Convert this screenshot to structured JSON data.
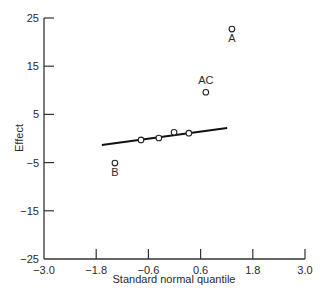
{
  "chart_data": {
    "type": "scatter",
    "title": "",
    "xlabel": "Standard normal quantile",
    "ylabel": "Effect",
    "xlim": [
      -3.0,
      3.0
    ],
    "ylim": [
      -25,
      25
    ],
    "xticks": [
      -3.0,
      -1.8,
      -0.6,
      0.6,
      1.8,
      3.0
    ],
    "xtick_labels": [
      "−3.0",
      "−1.8",
      "−0.6",
      "0.6",
      "1.8",
      "3.0"
    ],
    "yticks": [
      25,
      15,
      5,
      -5,
      -15,
      -25
    ],
    "ytick_labels": [
      "25",
      "15",
      "5",
      "−5",
      "−15",
      "−25"
    ],
    "grid": false,
    "legend": null,
    "points": [
      {
        "x": -1.37,
        "y": -5.1,
        "label": "B"
      },
      {
        "x": -0.77,
        "y": -0.3,
        "label": ""
      },
      {
        "x": -0.36,
        "y": 0.1,
        "label": ""
      },
      {
        "x": -0.01,
        "y": 1.3,
        "label": ""
      },
      {
        "x": 0.33,
        "y": 1.1,
        "label": ""
      },
      {
        "x": 0.72,
        "y": 9.6,
        "label": "AC"
      },
      {
        "x": 1.32,
        "y": 22.7,
        "label": "A"
      }
    ],
    "fit_line": {
      "x": [
        -1.67,
        1.21
      ],
      "y": [
        -1.35,
        2.2
      ]
    },
    "annotations": [
      {
        "text": "A",
        "position": "below"
      },
      {
        "text": "AC",
        "position": "above"
      },
      {
        "text": "B",
        "position": "below"
      }
    ]
  }
}
